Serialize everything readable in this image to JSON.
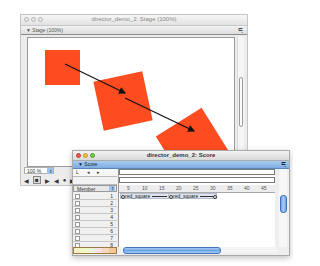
{
  "stage_window": {
    "title": "director_demo_2: Stage (100%)",
    "subtitle": "▼ Stage (100%)",
    "options_icon": "≒",
    "zoom_value": "100 %",
    "zoom_arrow": "⇕",
    "controls": [
      "◀",
      "■",
      "▶",
      "◀",
      "●",
      "▶"
    ],
    "shape_color": "#fc4c20"
  },
  "score_window": {
    "title": "director_demo_2: Score",
    "subtitle": "▼ Score",
    "options_icon": "≒",
    "markers_labels": [
      "L",
      "◂",
      "▸"
    ],
    "member_label": "Member",
    "member_arrow": "⇕",
    "ruler": [
      "5",
      "10",
      "15",
      "20",
      "25",
      "30",
      "35",
      "40",
      "45"
    ],
    "channels": [
      "1",
      "2",
      "3",
      "4",
      "5",
      "6",
      "7",
      "8"
    ],
    "sprites": [
      {
        "label": "red_square",
        "channel": 1,
        "start": 1,
        "end": 16
      },
      {
        "label": "red_square",
        "channel": 1,
        "start": 16,
        "end": 30
      }
    ]
  }
}
